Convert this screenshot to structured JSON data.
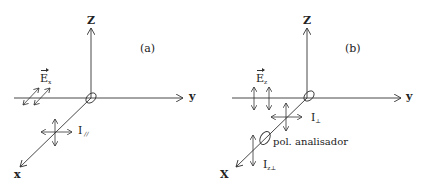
{
  "panels": [
    {
      "id": "a",
      "panel_label": "(a)",
      "axis_z": "Z",
      "axis_y": "y",
      "axis_x": "x",
      "field_label_main": "E",
      "field_label_sub": "x",
      "intensity_label_main": "I",
      "intensity_label_sub": "//"
    },
    {
      "id": "b",
      "panel_label": "(b)",
      "axis_z": "Z",
      "axis_y": "y",
      "axis_x": "X",
      "field_label_main": "E",
      "field_label_sub": "z",
      "intensity_label_main": "I",
      "intensity_label_sub": "⊥",
      "analyzer_label": "pol. analisador",
      "analyzed_intensity_main": "I",
      "analyzed_intensity_sub": "z⊥"
    }
  ],
  "colors": {
    "line": "#333333",
    "background": "#ffffff"
  }
}
